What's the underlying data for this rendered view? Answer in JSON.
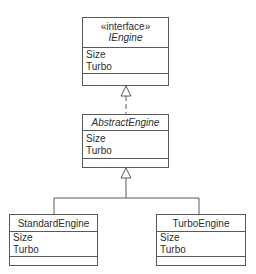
{
  "diagram": {
    "type": "uml-class-diagram",
    "classes": [
      {
        "id": "iengine",
        "stereotype": "«interface»",
        "name": "IEngine",
        "italic": true,
        "attributes": [
          "Size",
          "Turbo"
        ]
      },
      {
        "id": "abstractengine",
        "stereotype": "",
        "name": "AbstractEngine",
        "italic": true,
        "attributes": [
          "Size",
          "Turbo"
        ]
      },
      {
        "id": "standardengine",
        "stereotype": "",
        "name": "StandardEngine",
        "italic": false,
        "attributes": [
          "Size",
          "Turbo"
        ]
      },
      {
        "id": "turboengine",
        "stereotype": "",
        "name": "TurboEngine",
        "italic": false,
        "attributes": [
          "Size",
          "Turbo"
        ]
      }
    ],
    "relationships": [
      {
        "from": "AbstractEngine",
        "to": "IEngine",
        "kind": "realization",
        "line": "dashed"
      },
      {
        "from": "StandardEngine",
        "to": "AbstractEngine",
        "kind": "generalization",
        "line": "solid"
      },
      {
        "from": "TurboEngine",
        "to": "AbstractEngine",
        "kind": "generalization",
        "line": "solid"
      }
    ],
    "colors": {
      "line": "#5a5a5a",
      "text": "#2e2e2e",
      "background": "#ffffff"
    }
  }
}
